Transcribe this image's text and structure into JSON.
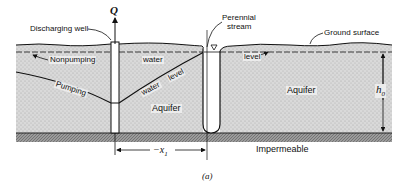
{
  "figure": {
    "caption": "(a)",
    "labels": {
      "discharge_symbol": "Q",
      "discharging_well": "Discharging well",
      "perennial_stream_line1": "Perennial",
      "perennial_stream_line2": "stream",
      "ground_surface": "Ground surface",
      "nonpumping": "Nonpumping",
      "water_left": "water",
      "level_right": "level",
      "pumping": "Pumping",
      "water_diag": "water",
      "level_diag": "level",
      "aquifer_left": "Aquifer",
      "aquifer_right": "Aquifer",
      "impermeable": "Impermeable",
      "h0_symbol": "h",
      "h0_subscript": "0",
      "x1_symbol": "−x",
      "x1_subscript": "1"
    },
    "colors": {
      "aquifer_fill": "#d6d6d6",
      "impermeable_fill": "#8a8a8a",
      "line": "#111111",
      "background": "#ffffff"
    }
  }
}
